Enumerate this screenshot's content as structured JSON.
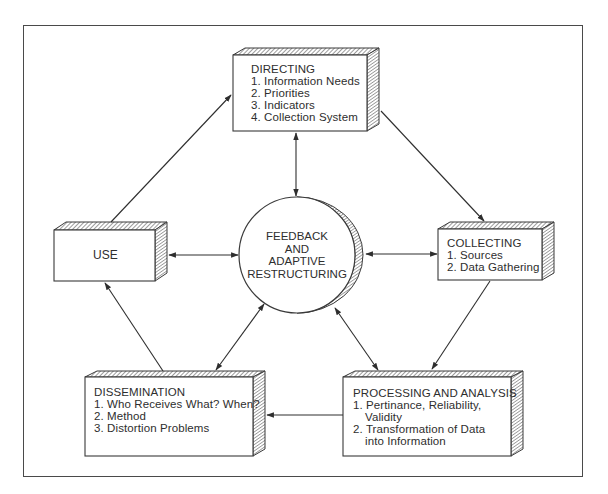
{
  "diagram": {
    "type": "cycle-flow",
    "colors": {
      "line": "#3a3a3a",
      "hatch": "#4a4a4a",
      "background": "#ffffff"
    },
    "center": {
      "lines": [
        "FEEDBACK",
        "AND",
        "ADAPTIVE",
        "RESTRUCTURING"
      ]
    },
    "nodes": {
      "directing": {
        "title": "DIRECTING",
        "items": [
          "1. Information Needs",
          "2. Priorities",
          "3. Indicators",
          "4. Collection System"
        ]
      },
      "collecting": {
        "title": "COLLECTING",
        "items": [
          "1. Sources",
          "2. Data Gathering"
        ]
      },
      "processing": {
        "title": "PROCESSING AND ANALYSIS",
        "item1_line1": "1. Pertinance, Reliability,",
        "item1_line2": "Validity",
        "item2_line1": "2. Transformation of Data",
        "item2_line2": "into Information"
      },
      "dissemination": {
        "title": "DISSEMINATION",
        "items": [
          "1. Who Receives What? When?",
          "2. Method",
          "3. Distortion Problems"
        ]
      },
      "use": {
        "title": "USE"
      }
    },
    "edges": [
      {
        "from": "use",
        "to": "directing",
        "direction": "one-way"
      },
      {
        "from": "directing",
        "to": "collecting",
        "direction": "one-way"
      },
      {
        "from": "collecting",
        "to": "processing",
        "direction": "one-way"
      },
      {
        "from": "processing",
        "to": "dissemination",
        "direction": "one-way"
      },
      {
        "from": "dissemination",
        "to": "use",
        "direction": "one-way"
      },
      {
        "from": "center",
        "to": "directing",
        "direction": "two-way"
      },
      {
        "from": "center",
        "to": "collecting",
        "direction": "two-way"
      },
      {
        "from": "center",
        "to": "processing",
        "direction": "two-way"
      },
      {
        "from": "center",
        "to": "dissemination",
        "direction": "two-way"
      },
      {
        "from": "center",
        "to": "use",
        "direction": "two-way"
      }
    ]
  }
}
